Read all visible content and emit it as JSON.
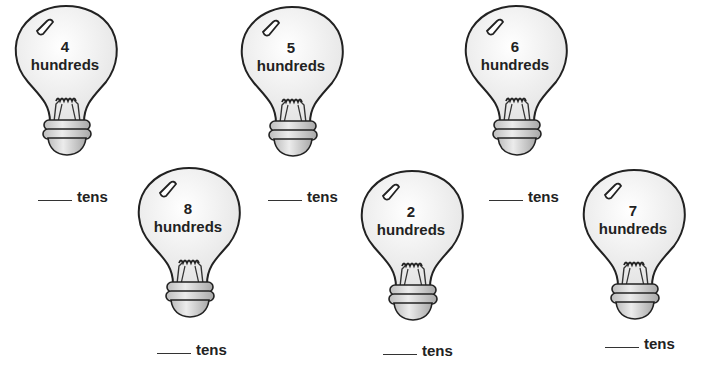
{
  "worksheet": {
    "unit_label": "hundreds",
    "answer_unit": "tens",
    "bulbs": [
      {
        "number": "4",
        "unit": "hundreds",
        "answer_label": "tens",
        "answer_value": ""
      },
      {
        "number": "5",
        "unit": "hundreds",
        "answer_label": "tens",
        "answer_value": ""
      },
      {
        "number": "6",
        "unit": "hundreds",
        "answer_label": "tens",
        "answer_value": ""
      },
      {
        "number": "8",
        "unit": "hundreds",
        "answer_label": "tens",
        "answer_value": ""
      },
      {
        "number": "2",
        "unit": "hundreds",
        "answer_label": "tens",
        "answer_value": ""
      },
      {
        "number": "7",
        "unit": "hundreds",
        "answer_label": "tens",
        "answer_value": ""
      }
    ]
  },
  "colors": {
    "outline": "#222222",
    "glass_fill": "#f2f2f2",
    "base_fill": "#d6d6d6",
    "text": "#222222"
  }
}
